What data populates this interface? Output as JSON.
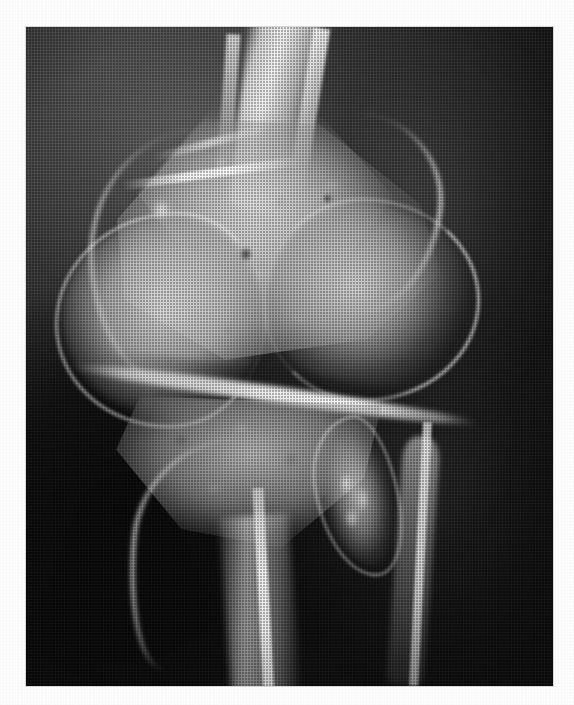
{
  "figure": {
    "modality": "radiograph",
    "view": "lateral",
    "anatomy": "knee",
    "caption": "",
    "plate": {
      "background_color": "#0a0a0a",
      "page_color": "#fdfdfd",
      "bone_color": "#e6e6e6",
      "soft_tissue_color": "#3b3b3b",
      "left_margin_px": 26,
      "top_margin_px": 27,
      "plate_width_px": 527,
      "plate_height_px": 659
    },
    "print": {
      "screen": "halftone-dot",
      "screen_pitch_px": 3
    },
    "structures": [
      {
        "id": "femur-shaft",
        "label": "Femoral shaft"
      },
      {
        "id": "femur-metaphysis",
        "label": "Distal femoral metaphysis"
      },
      {
        "id": "femur-ant-cortex",
        "label": "Anterior femoral cortex"
      },
      {
        "id": "femur-post-cortex",
        "label": "Posterior femoral cortex"
      },
      {
        "id": "cortical-streak",
        "label": "Cortical density streak"
      },
      {
        "id": "patella",
        "label": "Patella"
      },
      {
        "id": "condyle",
        "label": "Femoral condyle"
      },
      {
        "id": "joint-line",
        "label": "Tibiofemoral joint line"
      },
      {
        "id": "tibia-plateau",
        "label": "Tibial plateau"
      },
      {
        "id": "tibia-shaft",
        "label": "Tibial shaft"
      },
      {
        "id": "fibula",
        "label": "Proximal fibula"
      },
      {
        "id": "lesion",
        "label": "Ossified lesion"
      },
      {
        "id": "trabeculae",
        "label": "Trabecular bone texture"
      },
      {
        "id": "focal-lucency",
        "label": "Focal lucency"
      },
      {
        "id": "soft-tissue-edge",
        "label": "Soft tissue margin"
      }
    ]
  }
}
